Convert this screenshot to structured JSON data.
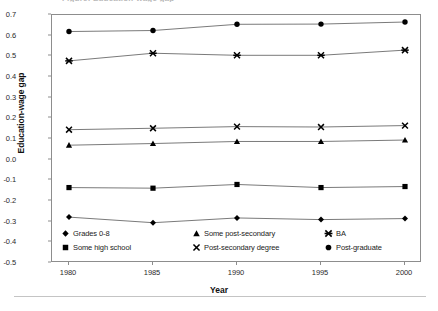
{
  "figure": {
    "title_remnant": "Figure: Education-wage gap",
    "bottom_rule": "horizontal-rule"
  },
  "axes": {
    "ylabel": "Education-wage gap",
    "xlabel": "Year",
    "yticks": [
      "0.7",
      "0.6",
      "0.5",
      "0.4",
      "0.3",
      "0.2",
      "0.1",
      "0.0",
      "-0.1",
      "-0.2",
      "-0.3",
      "-0.4",
      "-0.5"
    ],
    "xticks": [
      "1980",
      "1985",
      "1990",
      "1995",
      "2000"
    ]
  },
  "legend": {
    "entries": [
      {
        "label": "Grades 0-8",
        "marker": "diamond"
      },
      {
        "label": "Some high school",
        "marker": "square"
      },
      {
        "label": "Some post-secondary",
        "marker": "triangle"
      },
      {
        "label": "Post-secondary degree",
        "marker": "x-cross"
      },
      {
        "label": "BA",
        "marker": "asterisk"
      },
      {
        "label": "Post-graduate",
        "marker": "circle"
      }
    ]
  },
  "chart_data": {
    "type": "line",
    "title": "Education-wage gap",
    "xlabel": "Year",
    "ylabel": "Education-wage gap",
    "x": [
      1980,
      1985,
      1990,
      1995,
      2000
    ],
    "xlim": [
      1980,
      2000
    ],
    "ylim": [
      -0.5,
      0.7
    ],
    "ytick_step": 0.1,
    "grid": false,
    "legend_position": "inside-bottom",
    "line_color": "#6b6b6b",
    "marker_color": "#000000",
    "series": [
      {
        "name": "Grades 0-8",
        "marker": "diamond",
        "values": [
          -0.278,
          -0.305,
          -0.282,
          -0.29,
          -0.285
        ]
      },
      {
        "name": "Some high school",
        "marker": "square",
        "values": [
          -0.135,
          -0.138,
          -0.12,
          -0.135,
          -0.13
        ]
      },
      {
        "name": "Some post-secondary",
        "marker": "triangle",
        "values": [
          0.07,
          0.078,
          0.088,
          0.088,
          0.095
        ]
      },
      {
        "name": "Post-secondary degree",
        "marker": "x-cross",
        "values": [
          0.145,
          0.152,
          0.16,
          0.158,
          0.165
        ]
      },
      {
        "name": "BA",
        "marker": "asterisk",
        "values": [
          0.478,
          0.515,
          0.505,
          0.505,
          0.53
        ]
      },
      {
        "name": "Post-graduate",
        "marker": "circle",
        "values": [
          0.62,
          0.625,
          0.655,
          0.656,
          0.666
        ]
      }
    ]
  }
}
